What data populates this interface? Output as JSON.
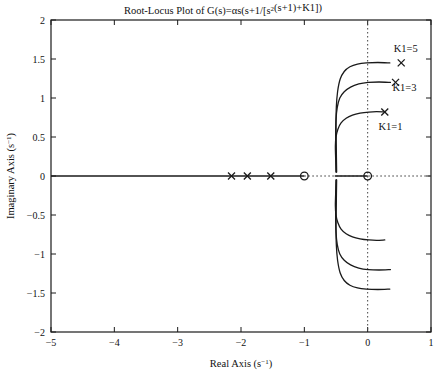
{
  "chart_data": {
    "type": "line",
    "xlabel": "Real Axis (s⁻¹)",
    "ylabel": "Imaginary Axis (s⁻¹)",
    "xlim": [
      -5,
      1
    ],
    "ylim": [
      -2,
      2
    ],
    "xticks": [
      -5,
      -4,
      -3,
      -2,
      -1,
      0,
      1
    ],
    "xticklabels": [
      "−5",
      "−4",
      "−3",
      "−2",
      "−1",
      "0",
      "1"
    ],
    "yticks": [
      -2,
      -1.5,
      -1,
      -0.5,
      0,
      0.5,
      1,
      1.5,
      2
    ],
    "yticklabels": [
      "−2",
      "−1.5",
      "−1",
      "−0.5",
      "0",
      "0.5",
      "1",
      "1.5",
      "2"
    ],
    "grid": false,
    "legend": "none",
    "reference_lines": [
      {
        "name": "real-axis-line",
        "orientation": "horizontal",
        "value": 0,
        "style": "solid"
      },
      {
        "name": "imaginary-axis-line",
        "orientation": "vertical",
        "value": 0,
        "style": "dotted"
      },
      {
        "name": "real-axis-dotted-extension",
        "orientation": "horizontal",
        "value": 0,
        "style": "dotted",
        "x_from": -1.0,
        "x_to": 1.0
      }
    ],
    "pole_markers": {
      "name": "open-loop-poles",
      "symbol": "x",
      "points": [
        {
          "x": -2.15,
          "y": 0
        },
        {
          "x": -1.9,
          "y": 0
        },
        {
          "x": -1.53,
          "y": 0
        }
      ]
    },
    "zero_markers": {
      "name": "open-loop-zeros",
      "symbol": "o",
      "points": [
        {
          "x": -1.0,
          "y": 0
        },
        {
          "x": 0.0,
          "y": 0
        }
      ]
    },
    "annotations": [
      {
        "label": "K1=5",
        "x": 0.6,
        "y": 1.64,
        "marker_x": 0.53,
        "marker_y": 1.45,
        "marker": "x"
      },
      {
        "label": "K1=3",
        "x": 0.58,
        "y": 1.13,
        "marker_x": 0.44,
        "marker_y": 1.2,
        "marker": "x"
      },
      {
        "label": "K1=1",
        "x": 0.36,
        "y": 0.63,
        "marker_x": 0.27,
        "marker_y": 0.82,
        "marker": "x"
      }
    ],
    "series": [
      {
        "name": "K1=1",
        "color": "#1a1a1a",
        "upper_branch": [
          [
            -0.5,
            0.05
          ],
          [
            -0.505,
            0.22
          ],
          [
            -0.51,
            0.38
          ],
          [
            -0.5,
            0.5
          ],
          [
            -0.47,
            0.6
          ],
          [
            -0.42,
            0.68
          ],
          [
            -0.34,
            0.74
          ],
          [
            -0.24,
            0.78
          ],
          [
            -0.12,
            0.805
          ],
          [
            0.02,
            0.82
          ],
          [
            0.14,
            0.825
          ],
          [
            0.27,
            0.82
          ]
        ],
        "lower_branch": [
          [
            -0.5,
            -0.05
          ],
          [
            -0.505,
            -0.22
          ],
          [
            -0.51,
            -0.38
          ],
          [
            -0.5,
            -0.5
          ],
          [
            -0.47,
            -0.6
          ],
          [
            -0.42,
            -0.68
          ],
          [
            -0.34,
            -0.74
          ],
          [
            -0.24,
            -0.78
          ],
          [
            -0.12,
            -0.805
          ],
          [
            0.02,
            -0.82
          ],
          [
            0.14,
            -0.825
          ],
          [
            0.27,
            -0.82
          ]
        ]
      },
      {
        "name": "K1=3",
        "color": "#1a1a1a",
        "upper_branch": [
          [
            -0.495,
            0.05
          ],
          [
            -0.5,
            0.28
          ],
          [
            -0.505,
            0.52
          ],
          [
            -0.5,
            0.72
          ],
          [
            -0.48,
            0.88
          ],
          [
            -0.44,
            1.0
          ],
          [
            -0.37,
            1.08
          ],
          [
            -0.27,
            1.14
          ],
          [
            -0.14,
            1.18
          ],
          [
            0.01,
            1.2
          ],
          [
            0.18,
            1.205
          ],
          [
            0.36,
            1.2
          ]
        ],
        "lower_branch": [
          [
            -0.495,
            -0.05
          ],
          [
            -0.5,
            -0.28
          ],
          [
            -0.505,
            -0.52
          ],
          [
            -0.5,
            -0.72
          ],
          [
            -0.48,
            -0.88
          ],
          [
            -0.44,
            -1.0
          ],
          [
            -0.37,
            -1.08
          ],
          [
            -0.27,
            -1.14
          ],
          [
            -0.14,
            -1.18
          ],
          [
            0.01,
            -1.2
          ],
          [
            0.18,
            -1.205
          ],
          [
            0.36,
            -1.2
          ]
        ]
      },
      {
        "name": "K1=5",
        "color": "#1a1a1a",
        "upper_branch": [
          [
            -0.49,
            0.05
          ],
          [
            -0.495,
            0.32
          ],
          [
            -0.5,
            0.62
          ],
          [
            -0.495,
            0.88
          ],
          [
            -0.475,
            1.08
          ],
          [
            -0.435,
            1.24
          ],
          [
            -0.37,
            1.34
          ],
          [
            -0.28,
            1.4
          ],
          [
            -0.16,
            1.435
          ],
          [
            -0.02,
            1.45
          ],
          [
            0.16,
            1.455
          ],
          [
            0.35,
            1.45
          ]
        ],
        "lower_branch": [
          [
            -0.49,
            -0.05
          ],
          [
            -0.495,
            -0.32
          ],
          [
            -0.5,
            -0.62
          ],
          [
            -0.495,
            -0.88
          ],
          [
            -0.475,
            -1.08
          ],
          [
            -0.435,
            -1.24
          ],
          [
            -0.37,
            -1.34
          ],
          [
            -0.28,
            -1.4
          ],
          [
            -0.16,
            -1.435
          ],
          [
            -0.02,
            -1.45
          ],
          [
            0.16,
            -1.455
          ],
          [
            0.35,
            -1.45
          ]
        ]
      }
    ]
  },
  "colors": {
    "background": "#ffffff",
    "frame": "#1a1a1a",
    "curve": "#1a1a1a",
    "text": "#111111"
  }
}
